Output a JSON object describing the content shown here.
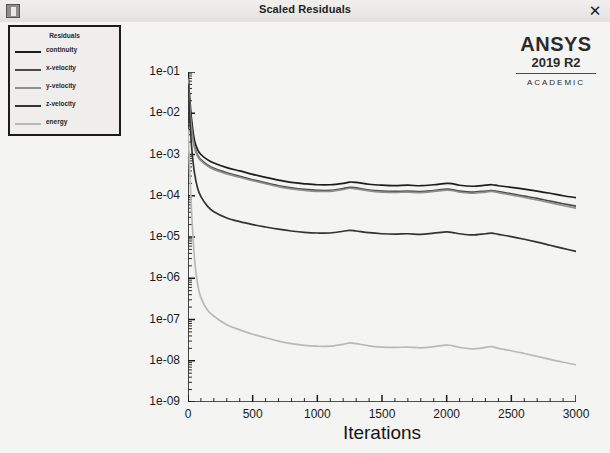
{
  "window": {
    "title": "Scaled Residuals",
    "icon": "fluent-window-icon",
    "close_label": "✕"
  },
  "logo": {
    "name": "ANSYS",
    "version": "2019 R2",
    "edition": "ACADEMIC"
  },
  "legend": {
    "title": "Residuals",
    "items": [
      {
        "label": "continuity",
        "color": "#1d1d1d"
      },
      {
        "label": "x-velocity",
        "color": "#4a4a4a"
      },
      {
        "label": "y-velocity",
        "color": "#8f8f8f"
      },
      {
        "label": "z-velocity",
        "color": "#333333"
      },
      {
        "label": "energy",
        "color": "#b9b9b9"
      }
    ]
  },
  "chart_data": {
    "type": "line",
    "title": "Scaled Residuals",
    "xlabel": "Iterations",
    "ylabel": "",
    "yscale": "log",
    "xlim": [
      0,
      3000
    ],
    "ylim": [
      1e-09,
      0.1
    ],
    "grid": false,
    "legend_position": "top-left",
    "xticks": [
      0,
      500,
      1000,
      1500,
      2000,
      2500,
      3000
    ],
    "xticklabels": [
      "0",
      "500",
      "1000",
      "1500",
      "2000",
      "2500",
      "3000"
    ],
    "yticks": [
      0.1,
      0.01,
      0.001,
      0.0001,
      1e-05,
      1e-06,
      1e-07,
      1e-08,
      1e-09
    ],
    "yticklabels": [
      "1e-01",
      "1e-02",
      "1e-03",
      "1e-04",
      "1e-05",
      "1e-06",
      "1e-07",
      "1e-08",
      "1e-09"
    ],
    "x": [
      0,
      15,
      30,
      50,
      75,
      100,
      150,
      200,
      300,
      400,
      500,
      600,
      700,
      800,
      900,
      1000,
      1100,
      1200,
      1250,
      1300,
      1400,
      1500,
      1600,
      1700,
      1800,
      1900,
      2000,
      2050,
      2100,
      2200,
      2300,
      2350,
      2400,
      2500,
      2600,
      2700,
      2800,
      2900,
      3000
    ],
    "series": [
      {
        "name": "continuity",
        "color": "#1d1d1d",
        "values": [
          0.1,
          0.02,
          0.006,
          0.0022,
          0.0013,
          0.001,
          0.00075,
          0.00062,
          0.00048,
          0.0004,
          0.00033,
          0.00028,
          0.00024,
          0.00021,
          0.000195,
          0.000185,
          0.000185,
          0.0002,
          0.000215,
          0.00021,
          0.00019,
          0.00018,
          0.000175,
          0.00018,
          0.000175,
          0.000185,
          0.0002,
          0.000195,
          0.00018,
          0.00017,
          0.00018,
          0.000185,
          0.000175,
          0.00016,
          0.000145,
          0.00013,
          0.000115,
          0.0001,
          9e-05
        ]
      },
      {
        "name": "x-velocity",
        "color": "#4a4a4a",
        "values": [
          0.07,
          0.013,
          0.004,
          0.0016,
          0.00095,
          0.00075,
          0.00056,
          0.00046,
          0.00036,
          0.000295,
          0.000245,
          0.000205,
          0.000175,
          0.000155,
          0.000142,
          0.000135,
          0.000135,
          0.00015,
          0.00016,
          0.000155,
          0.000138,
          0.00013,
          0.000127,
          0.00013,
          0.000126,
          0.000134,
          0.000145,
          0.00014,
          0.00013,
          0.000122,
          0.00013,
          0.000134,
          0.000126,
          0.000112,
          9.8e-05,
          8.6e-05,
          7.4e-05,
          6.4e-05,
          5.6e-05
        ]
      },
      {
        "name": "y-velocity",
        "color": "#8f8f8f",
        "values": [
          0.065,
          0.012,
          0.0037,
          0.0015,
          0.0009,
          0.00071,
          0.00053,
          0.000435,
          0.00034,
          0.00028,
          0.000232,
          0.000195,
          0.000166,
          0.000147,
          0.000135,
          0.000128,
          0.000128,
          0.000142,
          0.000152,
          0.000147,
          0.000131,
          0.000123,
          0.00012,
          0.000123,
          0.000119,
          0.000127,
          0.000137,
          0.000132,
          0.000123,
          0.000115,
          0.000123,
          0.000127,
          0.000119,
          0.000105,
          9.1e-05,
          7.9e-05,
          6.8e-05,
          5.8e-05,
          5e-05
        ]
      },
      {
        "name": "z-velocity",
        "color": "#333333",
        "values": [
          0.05,
          0.006,
          0.0013,
          0.00036,
          0.00015,
          9.5e-05,
          5.6e-05,
          4.1e-05,
          2.9e-05,
          2.35e-05,
          2e-05,
          1.75e-05,
          1.55e-05,
          1.4e-05,
          1.3e-05,
          1.25e-05,
          1.25e-05,
          1.38e-05,
          1.45e-05,
          1.4e-05,
          1.27e-05,
          1.2e-05,
          1.17e-05,
          1.2e-05,
          1.16e-05,
          1.24e-05,
          1.33e-05,
          1.28e-05,
          1.2e-05,
          1.12e-05,
          1.2e-05,
          1.24e-05,
          1.16e-05,
          1.02e-05,
          8.8e-06,
          7.5e-06,
          6.3e-06,
          5.3e-06,
          4.5e-06
        ]
      },
      {
        "name": "energy",
        "color": "#b9b9b9",
        "values": [
          0.004,
          0.0003,
          3e-05,
          3e-06,
          7e-07,
          3.4e-07,
          1.7e-07,
          1.2e-07,
          7.5e-08,
          5.6e-08,
          4.4e-08,
          3.6e-08,
          3e-08,
          2.6e-08,
          2.35e-08,
          2.25e-08,
          2.25e-08,
          2.5e-08,
          2.7e-08,
          2.6e-08,
          2.3e-08,
          2.15e-08,
          2.1e-08,
          2.15e-08,
          2.05e-08,
          2.2e-08,
          2.4e-08,
          2.3e-08,
          2.1e-08,
          1.95e-08,
          2.1e-08,
          2.2e-08,
          2e-08,
          1.75e-08,
          1.5e-08,
          1.28e-08,
          1.08e-08,
          9.2e-09,
          8e-09
        ]
      }
    ]
  }
}
